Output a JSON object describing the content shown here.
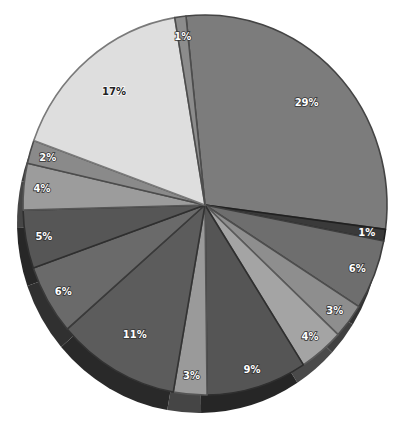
{
  "chart_data": {
    "type": "pie",
    "style": "3d-tilted",
    "title": "",
    "legend": null,
    "start_angle_deg": -96,
    "direction": "clockwise",
    "slices": [
      {
        "label": "29%",
        "value": 29,
        "color": "#7c7c7c",
        "label_dark": false
      },
      {
        "label": "1%",
        "value": 1,
        "color": "#3a3a3a",
        "label_dark": false
      },
      {
        "label": "6%",
        "value": 6,
        "color": "#6e6e6e",
        "label_dark": false
      },
      {
        "label": "3%",
        "value": 3,
        "color": "#8e8e8e",
        "label_dark": false
      },
      {
        "label": "4%",
        "value": 4,
        "color": "#a4a4a4",
        "label_dark": false
      },
      {
        "label": "9%",
        "value": 9,
        "color": "#555555",
        "label_dark": false
      },
      {
        "label": "3%",
        "value": 3,
        "color": "#9a9a9a",
        "label_dark": false
      },
      {
        "label": "11%",
        "value": 11,
        "color": "#5c5c5c",
        "label_dark": false
      },
      {
        "label": "6%",
        "value": 6,
        "color": "#6a6a6a",
        "label_dark": false
      },
      {
        "label": "5%",
        "value": 5,
        "color": "#565656",
        "label_dark": false
      },
      {
        "label": "4%",
        "value": 4,
        "color": "#9c9c9c",
        "label_dark": false
      },
      {
        "label": "2%",
        "value": 2,
        "color": "#8a8a8a",
        "label_dark": false
      },
      {
        "label": "17%",
        "value": 17,
        "color": "#dedede",
        "label_dark": true
      },
      {
        "label": "1%",
        "value": 1,
        "color": "#8c8c8c",
        "label_dark": false
      }
    ],
    "geometry": {
      "cx": 205,
      "cy": 205,
      "rx": 182,
      "ry": 190,
      "depth": 18
    }
  }
}
